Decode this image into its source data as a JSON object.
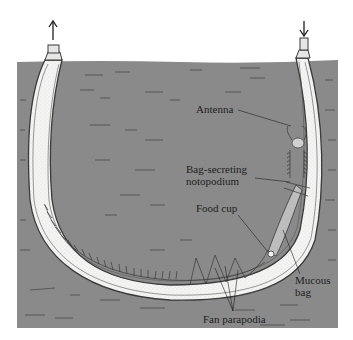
{
  "figure": {
    "colors": {
      "sediment": "#8a8a8a",
      "tube_interior": "#f4f4f2",
      "outline": "#3a3a3a",
      "label_text": "#1e1e1e",
      "background": "#ffffff"
    },
    "flow_arrows": [
      {
        "name": "outflow-arrow",
        "direction": "up",
        "tube": "left"
      },
      {
        "name": "inflow-arrow",
        "direction": "down",
        "tube": "right"
      }
    ],
    "labels": {
      "antenna": "Antenna",
      "notopodium_line1": "Bag-secreting",
      "notopodium_line2": "notopodium",
      "food_cup": "Food cup",
      "mucous_line1": "Mucous",
      "mucous_line2": "bag",
      "fan_parapodia": "Fan parapodia"
    }
  }
}
